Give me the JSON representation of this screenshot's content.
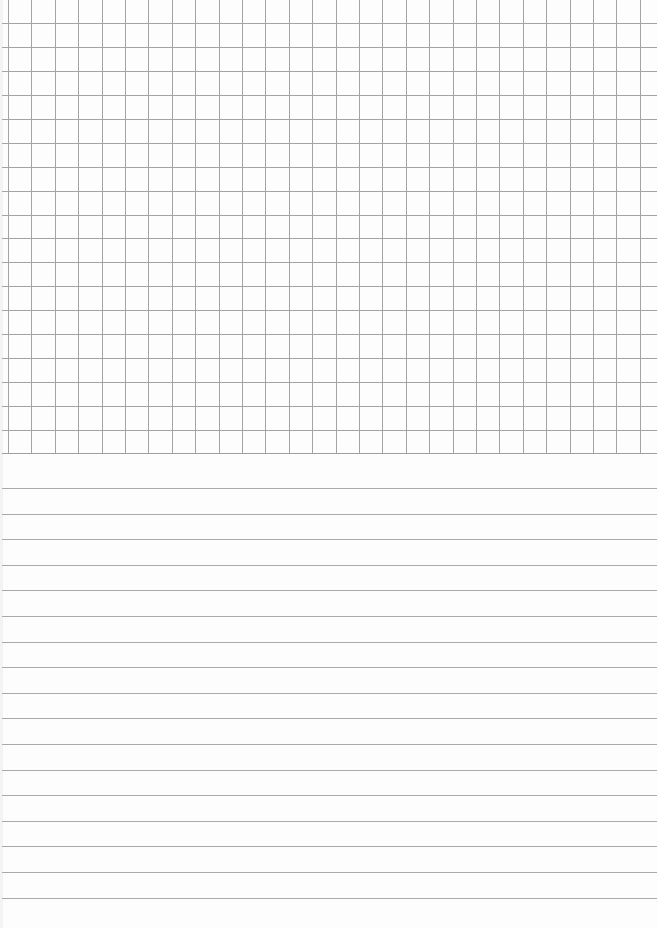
{
  "page": {
    "type": "notebook-sheet",
    "background_color": "#ffffff",
    "sections": [
      {
        "name": "graph-grid",
        "line_color": "#a3a3a3",
        "vertical_lines": 28,
        "horizontal_lines": 19,
        "cell_size_px": 23.5
      },
      {
        "name": "ruled-lines",
        "line_color": "#a9a9a9",
        "line_count": 17,
        "line_spacing_px": 25.6
      }
    ]
  }
}
